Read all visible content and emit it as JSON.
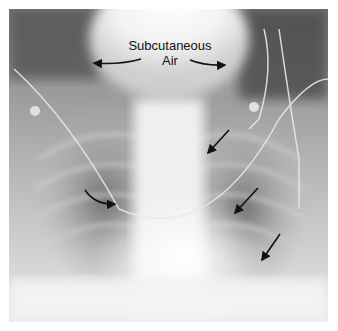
{
  "figure": {
    "type": "chest-radiograph",
    "view": "frontal",
    "background": "#ffffff",
    "annotation": {
      "label_line1": "Subcutaneous",
      "label_line2": "Air"
    },
    "arrows": [
      {
        "name": "subcutaneous-air-arrow-left",
        "style": "curved"
      },
      {
        "name": "subcutaneous-air-arrow-right",
        "style": "curved"
      },
      {
        "name": "hilum-curved-arrow",
        "style": "curved"
      },
      {
        "name": "left-lung-arrow-upper",
        "style": "straight"
      },
      {
        "name": "left-lung-arrow-middle",
        "style": "straight"
      },
      {
        "name": "left-lung-arrow-lower",
        "style": "straight"
      }
    ]
  }
}
